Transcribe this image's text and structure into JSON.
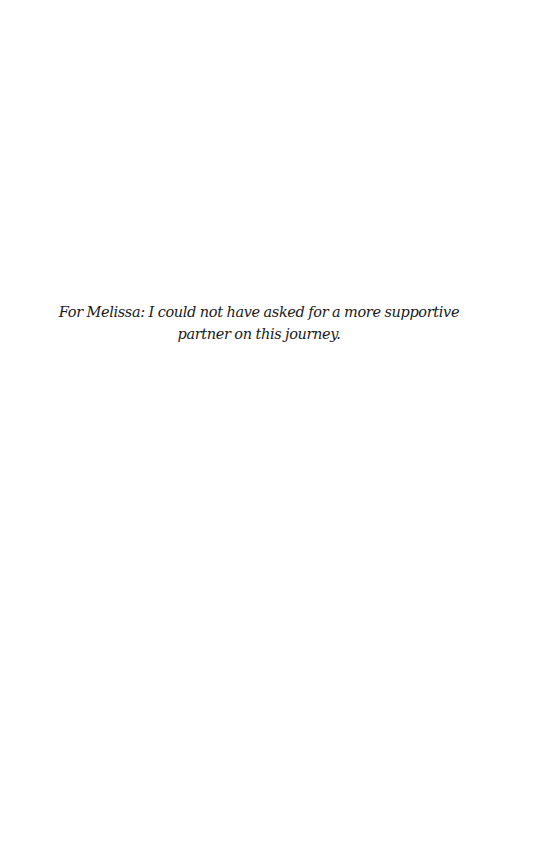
{
  "page": {
    "type": "dedication",
    "dedication_text": "For Melissa: I could not have asked for a more supportive partner on this journey.",
    "text_color": "#1a1a1a",
    "background_color": "#ffffff"
  }
}
